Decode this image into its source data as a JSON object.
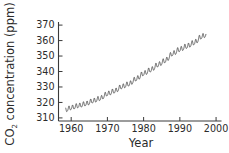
{
  "chart_data": {
    "type": "line",
    "title": "",
    "subtitle": "",
    "xlabel": "Year",
    "ylabel_main": "CO",
    "ylabel_sub": "2",
    "ylabel_rest": " concentration (ppm)",
    "ylabel_full": "CO2 concentration (ppm)",
    "xlim": [
      1956.5,
      2001.5
    ],
    "ylim": [
      308,
      372
    ],
    "xticks": [
      1960,
      1970,
      1980,
      1990,
      2000
    ],
    "xticklabels": [
      "1960",
      "1970",
      "1980",
      "1990",
      "2000"
    ],
    "yticks": [
      310,
      320,
      330,
      340,
      350,
      360,
      370
    ],
    "yticklabels": [
      "310",
      "320",
      "330",
      "340",
      "350",
      "360",
      "370"
    ],
    "grid": false,
    "legend": null,
    "annotations": [],
    "series": [
      {
        "name": "Mauna Loa monthly mean CO2",
        "color": "#3a3a3a",
        "x_start": 1958.5,
        "x_end": 1997.2,
        "seasonal_cycle": true,
        "trend_anchors": [
          {
            "x": 1958.5,
            "y": 315.2
          },
          {
            "x": 1960.0,
            "y": 316.5
          },
          {
            "x": 1962.0,
            "y": 317.8
          },
          {
            "x": 1964.0,
            "y": 319.0
          },
          {
            "x": 1966.0,
            "y": 320.9
          },
          {
            "x": 1968.0,
            "y": 322.5
          },
          {
            "x": 1970.0,
            "y": 325.5
          },
          {
            "x": 1972.0,
            "y": 327.3
          },
          {
            "x": 1974.0,
            "y": 330.1
          },
          {
            "x": 1976.0,
            "y": 331.9
          },
          {
            "x": 1978.0,
            "y": 335.2
          },
          {
            "x": 1980.0,
            "y": 338.6
          },
          {
            "x": 1982.0,
            "y": 341.0
          },
          {
            "x": 1984.0,
            "y": 344.3
          },
          {
            "x": 1986.0,
            "y": 347.0
          },
          {
            "x": 1988.0,
            "y": 351.4
          },
          {
            "x": 1990.0,
            "y": 354.2
          },
          {
            "x": 1992.0,
            "y": 356.3
          },
          {
            "x": 1994.0,
            "y": 358.6
          },
          {
            "x": 1996.0,
            "y": 362.4
          },
          {
            "x": 1997.2,
            "y": 363.6
          }
        ],
        "amplitude_start": 2.9,
        "amplitude_end": 3.2,
        "peak_month_fraction": 0.37,
        "annual_values": [
          {
            "year": 1959,
            "value": 315.9
          },
          {
            "year": 1960,
            "value": 316.9
          },
          {
            "year": 1961,
            "value": 317.6
          },
          {
            "year": 1962,
            "value": 318.4
          },
          {
            "year": 1963,
            "value": 318.9
          },
          {
            "year": 1964,
            "value": 319.6
          },
          {
            "year": 1965,
            "value": 320.0
          },
          {
            "year": 1966,
            "value": 321.4
          },
          {
            "year": 1967,
            "value": 322.2
          },
          {
            "year": 1968,
            "value": 323.0
          },
          {
            "year": 1969,
            "value": 324.6
          },
          {
            "year": 1970,
            "value": 325.7
          },
          {
            "year": 1971,
            "value": 326.3
          },
          {
            "year": 1972,
            "value": 327.5
          },
          {
            "year": 1973,
            "value": 329.7
          },
          {
            "year": 1974,
            "value": 330.2
          },
          {
            "year": 1975,
            "value": 331.1
          },
          {
            "year": 1976,
            "value": 332.0
          },
          {
            "year": 1977,
            "value": 333.8
          },
          {
            "year": 1978,
            "value": 335.4
          },
          {
            "year": 1979,
            "value": 336.8
          },
          {
            "year": 1980,
            "value": 338.7
          },
          {
            "year": 1981,
            "value": 340.1
          },
          {
            "year": 1982,
            "value": 341.4
          },
          {
            "year": 1983,
            "value": 343.0
          },
          {
            "year": 1984,
            "value": 344.6
          },
          {
            "year": 1985,
            "value": 346.0
          },
          {
            "year": 1986,
            "value": 347.4
          },
          {
            "year": 1987,
            "value": 349.2
          },
          {
            "year": 1988,
            "value": 351.6
          },
          {
            "year": 1989,
            "value": 353.1
          },
          {
            "year": 1990,
            "value": 354.4
          },
          {
            "year": 1991,
            "value": 355.6
          },
          {
            "year": 1992,
            "value": 356.4
          },
          {
            "year": 1993,
            "value": 357.1
          },
          {
            "year": 1994,
            "value": 358.8
          },
          {
            "year": 1995,
            "value": 360.8
          },
          {
            "year": 1996,
            "value": 362.6
          },
          {
            "year": 1997,
            "value": 363.8
          }
        ]
      }
    ],
    "axis_color": "#3a3a3a",
    "background": "#ffffff"
  }
}
